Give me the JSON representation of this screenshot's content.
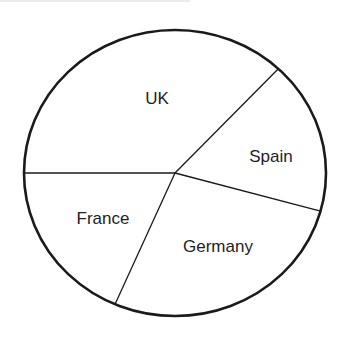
{
  "chart_data": {
    "type": "pie",
    "title": "",
    "start_angle_deg": 180,
    "direction": "counterclockwise-from-west-going-down",
    "categories": [
      "UK",
      "France",
      "Germany",
      "Spain"
    ],
    "values": [
      37,
      18.5,
      27.2,
      17.3
    ],
    "unit": "percent (estimated from slice angles)",
    "labels": [
      {
        "text": "UK",
        "x": 157,
        "y": 100
      },
      {
        "text": "France",
        "x": 103,
        "y": 220
      },
      {
        "text": "Germany",
        "x": 218,
        "y": 248
      },
      {
        "text": "Spain",
        "x": 271,
        "y": 158
      }
    ],
    "legend": null,
    "fill_color": "#ffffff",
    "stroke_color": "#1a1a1a"
  },
  "geometry": {
    "cx": 175,
    "cy": 173,
    "rx": 151,
    "ry": 143
  }
}
